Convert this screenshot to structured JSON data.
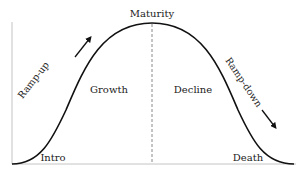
{
  "diagram": {
    "labels": {
      "peak": "Maturity",
      "growth": "Growth",
      "decline": "Decline",
      "intro": "Intro",
      "death": "Death",
      "ramp_up": "Ramp-up",
      "ramp_down": "Ramp-down"
    },
    "colors": {
      "curve": "#111111",
      "axis": "#bbbbbb",
      "divider": "#888888",
      "text": "#222222"
    }
  }
}
